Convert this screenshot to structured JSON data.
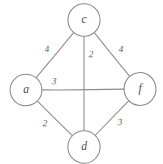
{
  "figure": {
    "kind": "undirected-weighted-graph-sketch",
    "style": "hand-drawn pencil sketch",
    "background_color": "#ffffff",
    "stroke_color": "#8d8d90",
    "label_color": "#4a4a4e"
  },
  "chart_data": {
    "type": "diagram",
    "title": "",
    "xlabel": "",
    "ylabel": "",
    "nodes": [
      {
        "id": "c",
        "label": "c",
        "cx": 84,
        "cy": 20,
        "r": 16
      },
      {
        "id": "a",
        "label": "a",
        "cx": 26,
        "cy": 90,
        "r": 16
      },
      {
        "id": "f",
        "label": "f",
        "cx": 140,
        "cy": 89,
        "r": 16
      },
      {
        "id": "d",
        "label": "d",
        "cx": 84,
        "cy": 147,
        "r": 16
      }
    ],
    "edges": [
      {
        "id": "a-c",
        "source": "a",
        "target": "c",
        "weight": "4",
        "label_x": 47,
        "label_y": 50
      },
      {
        "id": "c-f",
        "source": "c",
        "target": "f",
        "weight": "4",
        "label_x": 121,
        "label_y": 50
      },
      {
        "id": "c-d",
        "source": "c",
        "target": "d",
        "weight": "2",
        "label_x": 91,
        "label_y": 55
      },
      {
        "id": "a-f",
        "source": "a",
        "target": "f",
        "weight": "3",
        "label_x": 54,
        "label_y": 82
      },
      {
        "id": "a-d",
        "source": "a",
        "target": "d",
        "weight": "2",
        "label_x": 45,
        "label_y": 124
      },
      {
        "id": "d-f",
        "source": "d",
        "target": "f",
        "weight": "3",
        "label_x": 120,
        "label_y": 123
      }
    ]
  }
}
